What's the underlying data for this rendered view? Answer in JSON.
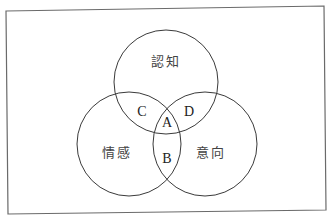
{
  "diagram": {
    "type": "venn",
    "sets": [
      {
        "id": "cognition",
        "label": "認知"
      },
      {
        "id": "affect",
        "label": "情感"
      },
      {
        "id": "conation",
        "label": "意向"
      }
    ],
    "regions": [
      {
        "label": "A",
        "sets": [
          "cognition",
          "affect",
          "conation"
        ]
      },
      {
        "label": "B",
        "sets": [
          "affect",
          "conation"
        ]
      },
      {
        "label": "C",
        "sets": [
          "cognition",
          "affect"
        ]
      },
      {
        "label": "D",
        "sets": [
          "cognition",
          "conation"
        ]
      }
    ],
    "colors": {
      "stroke": "#3a3a3a",
      "frame": "#6a6a6a",
      "background": "#ffffff"
    }
  }
}
